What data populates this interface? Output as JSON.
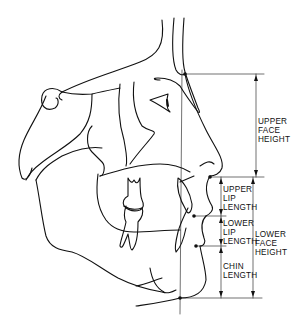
{
  "figure": {
    "type": "cephalometric-tracing",
    "stroke_color": "#111111",
    "background": "#ffffff"
  },
  "labels": {
    "upper_face_height": "UPPER\nFACE\nHEIGHT",
    "upper_lip_length": "UPPER\nLIP\nLENGTH",
    "lower_lip_length": "LOWER\nLIP\nLENGTH",
    "lower_face_height": "LOWER\nFACE\nHEIGHT",
    "chin_length": "CHIN\nLENGTH"
  },
  "reference_lines": {
    "nasion_y": 74,
    "subnasale_y": 177,
    "stomion_y": 216,
    "lower_lip_y": 246,
    "menton_y": 298
  }
}
